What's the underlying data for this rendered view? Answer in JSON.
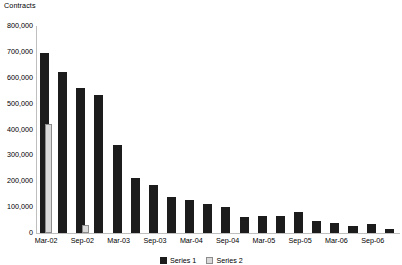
{
  "chart_data": {
    "type": "bar",
    "title": "",
    "ylabel": "Contracts",
    "xlabel": "",
    "ylim": [
      0,
      800000
    ],
    "ytick_labels": [
      "800,000",
      "700,000",
      "600,000",
      "500,000",
      "400,000",
      "300,000",
      "200,000",
      "100,000",
      "0"
    ],
    "ytick_values": [
      800000,
      700000,
      600000,
      500000,
      400000,
      300000,
      200000,
      100000,
      0
    ],
    "grid": false,
    "legend_position": "bottom",
    "x": [
      "Mar-02",
      "Jun-02",
      "Sep-02",
      "Dec-02",
      "Mar-03",
      "Jun-03",
      "Sep-03",
      "Dec-03",
      "Mar-04",
      "Jun-04",
      "Sep-04",
      "Dec-04",
      "Mar-05",
      "Jun-05",
      "Sep-05",
      "Dec-05",
      "Mar-06",
      "Jun-06",
      "Sep-06",
      "Dec-06"
    ],
    "xtick_labels": [
      "Mar-02",
      "Sep-02",
      "Mar-03",
      "Sep-03",
      "Mar-04",
      "Sep-04",
      "Mar-05",
      "Sep-05",
      "Mar-06",
      "Sep-06"
    ],
    "series": [
      {
        "name": "Series 1",
        "color": "#1c1c1c",
        "values": [
          695000,
          622000,
          562000,
          533000,
          342000,
          213000,
          184000,
          141000,
          128000,
          112000,
          100000,
          62000,
          64000,
          66000,
          83000,
          47000,
          39000,
          27000,
          33000,
          14000
        ]
      },
      {
        "name": "Series 2",
        "color": "#d9d9d9",
        "values": [
          420000,
          0,
          30000,
          0,
          0,
          0,
          0,
          0,
          0,
          0,
          0,
          0,
          0,
          0,
          0,
          0,
          0,
          0,
          0,
          0
        ]
      }
    ],
    "legend_entries": [
      "Series 1",
      "Series 2"
    ]
  }
}
